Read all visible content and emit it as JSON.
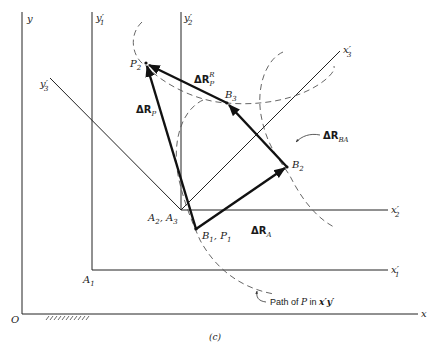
{
  "figure": {
    "caption": "(c)",
    "origin_label": "O",
    "axes": {
      "x": "x",
      "y": "y",
      "x1p": "x′",
      "x1p_sub": "1",
      "y1p": "y′",
      "y1p_sub": "1",
      "x2p": "x′",
      "x2p_sub": "2",
      "y2p": "y′",
      "y2p_sub": "2",
      "x3p": "x′",
      "x3p_sub": "3",
      "y3p": "y′",
      "y3p_sub": "3"
    },
    "points": {
      "A1": "A",
      "A1_sub": "1",
      "A23": "A",
      "A23_sub1": "2",
      "A23_sep": ", A",
      "A23_sub2": "3",
      "B1P1": "B",
      "B1P1_sub1": "1",
      "B1P1_sep": ", P",
      "B1P1_sub2": "1",
      "B2": "B",
      "B2_sub": "2",
      "B3": "B",
      "B3_sub": "3",
      "P2": "P",
      "P2_sub": "2"
    },
    "vectors": {
      "dRP": "ΔR",
      "dRP_sub": "P",
      "dRA": "ΔR",
      "dRA_sub": "A",
      "dRBA": "ΔR",
      "dRBA_sub": "BA",
      "dRPR": "ΔR",
      "dRPR_sub": "P",
      "dRPR_sup": "R"
    },
    "path_note": {
      "prefix": "Path of ",
      "var": "P",
      "mid": " in ",
      "frame": "x′y′"
    }
  }
}
